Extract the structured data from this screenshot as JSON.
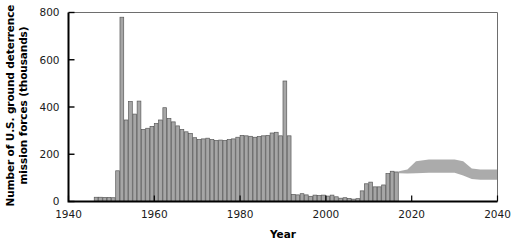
{
  "chart_data": {
    "type": "bar",
    "title": "",
    "xlabel": "Year",
    "ylabel": "Number of U.S. ground deterrence mission forces (thousands)",
    "xlim": [
      1940,
      2040
    ],
    "ylim": [
      0,
      800
    ],
    "yticks": [
      0,
      200,
      400,
      600,
      800
    ],
    "xticks": [
      1940,
      1960,
      1980,
      2000,
      2020,
      2040
    ],
    "grid": false,
    "legend": null,
    "bar_color": "#a6a6a6",
    "bar_edge_color": "#595959",
    "band_color": "#a6a6a6",
    "axis_color": "#000000",
    "series": [
      {
        "name": "Historical ground deterrence mission forces",
        "units": "thousands",
        "x": [
          1946,
          1947,
          1948,
          1949,
          1950,
          1951,
          1952,
          1953,
          1954,
          1955,
          1956,
          1957,
          1958,
          1959,
          1960,
          1961,
          1962,
          1963,
          1964,
          1965,
          1966,
          1967,
          1968,
          1969,
          1970,
          1971,
          1972,
          1973,
          1974,
          1975,
          1976,
          1977,
          1978,
          1979,
          1980,
          1981,
          1982,
          1983,
          1984,
          1985,
          1986,
          1987,
          1988,
          1989,
          1990,
          1991,
          1992,
          1993,
          1994,
          1995,
          1996,
          1997,
          1998,
          1999,
          2000,
          2001,
          2002,
          2003,
          2004,
          2005,
          2006,
          2007,
          2008,
          2009,
          2010,
          2011,
          2012,
          2013,
          2014,
          2015,
          2016
        ],
        "values": [
          18,
          18,
          17,
          17,
          16,
          130,
          780,
          345,
          423,
          370,
          425,
          305,
          310,
          318,
          330,
          345,
          397,
          352,
          337,
          320,
          305,
          295,
          288,
          270,
          262,
          265,
          268,
          262,
          258,
          260,
          258,
          262,
          265,
          272,
          280,
          278,
          276,
          272,
          275,
          278,
          280,
          290,
          293,
          278,
          510,
          278,
          30,
          28,
          33,
          28,
          22,
          27,
          25,
          27,
          23,
          27,
          20,
          14,
          16,
          13,
          10,
          12,
          45,
          75,
          82,
          62,
          62,
          70,
          118,
          128,
          125
        ]
      }
    ],
    "projection": {
      "name": "Projected range (shaded band)",
      "start_year": 2017,
      "end_year": 2040,
      "upper": [
        {
          "year": 2017,
          "value": 128
        },
        {
          "year": 2019,
          "value": 135
        },
        {
          "year": 2021,
          "value": 170
        },
        {
          "year": 2024,
          "value": 178
        },
        {
          "year": 2030,
          "value": 178
        },
        {
          "year": 2032,
          "value": 170
        },
        {
          "year": 2034,
          "value": 140
        },
        {
          "year": 2036,
          "value": 135
        },
        {
          "year": 2040,
          "value": 135
        }
      ],
      "lower": [
        {
          "year": 2017,
          "value": 120
        },
        {
          "year": 2019,
          "value": 118
        },
        {
          "year": 2021,
          "value": 120
        },
        {
          "year": 2024,
          "value": 122
        },
        {
          "year": 2030,
          "value": 122
        },
        {
          "year": 2032,
          "value": 110
        },
        {
          "year": 2034,
          "value": 95
        },
        {
          "year": 2036,
          "value": 92
        },
        {
          "year": 2040,
          "value": 92
        }
      ]
    }
  },
  "axes": {
    "y_tick_labels": [
      "800",
      "600",
      "400",
      "200",
      "0"
    ],
    "x_tick_labels": [
      "1940",
      "1960",
      "1980",
      "2000",
      "2020",
      "2040"
    ],
    "y_title": "Number of U.S. ground deterrence\nmission forces (thousands)",
    "y_title_line1": "Number of U.S. ground deterrence",
    "y_title_line2": "mission forces (thousands)",
    "x_title": "Year"
  }
}
